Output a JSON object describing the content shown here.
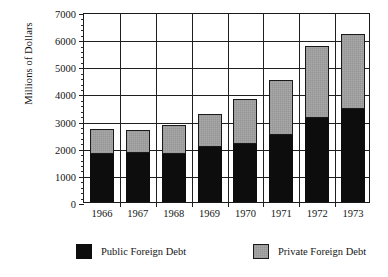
{
  "chart_data": {
    "type": "bar",
    "subtype": "stacked-vertical",
    "title": "",
    "xlabel": "",
    "ylabel": "Millions of Dollars",
    "categories": [
      "1966",
      "1967",
      "1968",
      "1969",
      "1970",
      "1971",
      "1972",
      "1973"
    ],
    "series": [
      {
        "name": "Public Foreign Debt",
        "color": "#0d0d0d",
        "values": [
          1770,
          1800,
          1770,
          2030,
          2140,
          2470,
          3100,
          3430
        ]
      },
      {
        "name": "Private Foreign Debt",
        "color": "#a8a8a8",
        "values": [
          920,
          850,
          1070,
          1210,
          1660,
          2030,
          2650,
          2770
        ]
      }
    ],
    "totals": [
      2690,
      2650,
      2840,
      3240,
      3800,
      4500,
      5750,
      6200
    ],
    "ylim": [
      0,
      7000
    ],
    "yticks": [
      0,
      1000,
      2000,
      3000,
      4000,
      5000,
      6000,
      7000
    ],
    "ytick_labels": [
      "0",
      "1000",
      "2000",
      "3000",
      "4000",
      "5000",
      "6000",
      "7000"
    ],
    "yminor_interval": 200,
    "grid": "both",
    "legend_position": "bottom",
    "legend_entries": [
      "Public Foreign Debt",
      "Private Foreign Debt"
    ]
  },
  "axes": {
    "y_title": "Millions of Dollars"
  },
  "legend": {
    "public_label": "Public Foreign Debt",
    "private_label": "Private Foreign Debt"
  }
}
